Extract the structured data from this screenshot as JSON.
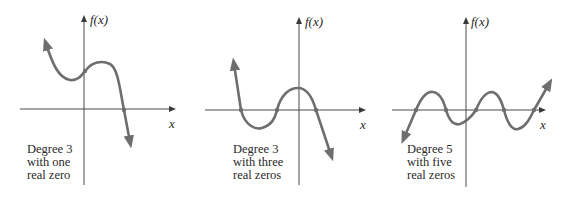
{
  "figure": {
    "panels": [
      {
        "y_axis_label": "f(x)",
        "x_axis_label": "x",
        "caption": [
          "Degree 3",
          "with one",
          "real zero"
        ],
        "degree": 3,
        "real_zeros": 1
      },
      {
        "y_axis_label": "f(x)",
        "x_axis_label": "x",
        "caption": [
          "Degree 3",
          "with three",
          "real zeros"
        ],
        "degree": 3,
        "real_zeros": 3
      },
      {
        "y_axis_label": "f(x)",
        "x_axis_label": "x",
        "caption": [
          "Degree 5",
          "with five",
          "real zeros"
        ],
        "degree": 5,
        "real_zeros": 5
      }
    ],
    "colors": {
      "curve": "#6e6e6e",
      "axis": "#4a4a4a",
      "text": "#2a2a2a"
    }
  }
}
